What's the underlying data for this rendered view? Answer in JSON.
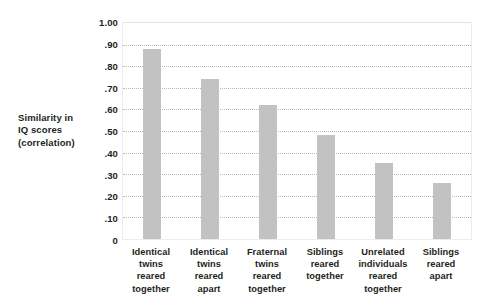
{
  "chart_data": {
    "type": "bar",
    "title": "",
    "subtitle": "",
    "xlabel": "",
    "ylabel": "Similarity in IQ scores (correlation)",
    "ylabel_lines": [
      "Similarity in",
      "IQ scores",
      "(correlation)"
    ],
    "categories": [
      "Identical twins reared together",
      "Identical twins reared apart",
      "Fraternal twins reared together",
      "Siblings reared together",
      "Unrelated individuals reared together",
      "Siblings reared apart"
    ],
    "category_lines": [
      [
        "Identical",
        "twins",
        "reared",
        "together"
      ],
      [
        "Identical",
        "twins",
        "reared",
        "apart"
      ],
      [
        "Fraternal",
        "twins",
        "reared",
        "together"
      ],
      [
        "Siblings",
        "reared",
        "together"
      ],
      [
        "Unrelated",
        "individuals",
        "reared",
        "together"
      ],
      [
        "Siblings",
        "reared",
        "apart"
      ]
    ],
    "values": [
      0.88,
      0.74,
      0.62,
      0.48,
      0.35,
      0.26
    ],
    "ylim": [
      0,
      1.0
    ],
    "ytick_values": [
      1.0,
      0.9,
      0.8,
      0.7,
      0.6,
      0.5,
      0.4,
      0.3,
      0.2,
      0.1,
      0
    ],
    "ytick_labels": [
      "1.00",
      ".90",
      ".80",
      ".70",
      ".60",
      ".50",
      ".40",
      ".30",
      ".20",
      ".10",
      "0"
    ],
    "grid": true,
    "grid_style": "dotted",
    "legend": false,
    "legend_position": "none",
    "bar_color": "#c2c2c2",
    "gridline_color": "#b9b9ba",
    "text_color": "#231f20",
    "background_color": "#ffffff"
  }
}
